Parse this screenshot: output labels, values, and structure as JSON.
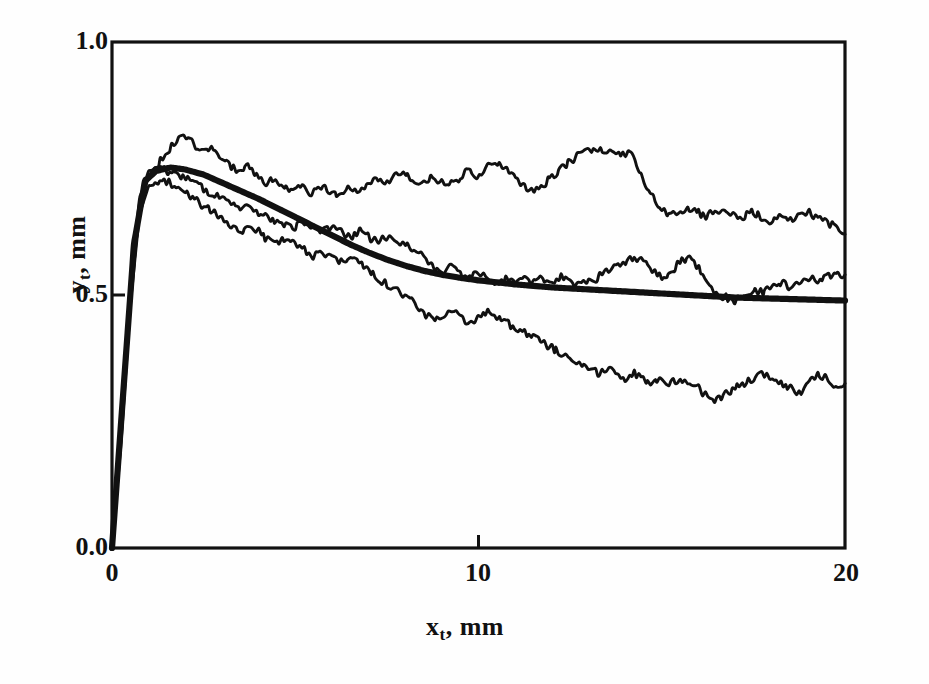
{
  "figure": {
    "background": "#fefefe",
    "ink_color": "#111111"
  },
  "axes": {
    "y_label_main": "y",
    "y_label_sub": "t",
    "y_label_tail": ", mm",
    "x_label_main": "x",
    "x_label_sub": "t",
    "x_label_tail": ", mm",
    "y_ticks": [
      "1.0",
      "0.5",
      "0.0"
    ],
    "x_ticks": [
      "0",
      "10",
      "20"
    ]
  },
  "chart_data": {
    "type": "line",
    "title": "",
    "xlabel": "x_t , mm",
    "ylabel": "y_t , mm",
    "xlim": [
      0,
      20
    ],
    "ylim": [
      0.0,
      1.0
    ],
    "xticks": [
      0,
      10,
      20
    ],
    "yticks": [
      0.0,
      0.5,
      1.0
    ],
    "grid": false,
    "legend": "none",
    "frame": "box",
    "series": [
      {
        "name": "upper-noisy-trace",
        "style": "thin-noisy",
        "x": [
          0,
          0.25,
          0.5,
          0.75,
          1.0,
          1.2,
          1.45,
          1.7,
          1.95,
          2.2,
          2.45,
          2.7,
          2.95,
          3.2,
          3.45,
          3.7,
          3.95,
          4.2,
          4.45,
          4.7,
          4.95,
          5.2,
          5.45,
          5.7,
          5.95,
          6.2,
          6.45,
          6.7,
          6.95,
          7.2,
          7.45,
          7.7,
          7.95,
          8.2,
          8.45,
          8.7,
          8.95,
          9.2,
          9.45,
          9.7,
          9.95,
          10.2,
          10.45,
          10.7,
          10.95,
          11.2,
          11.45,
          11.7,
          11.95,
          12.2,
          12.45,
          12.7,
          12.95,
          13.2,
          13.45,
          13.7,
          13.95,
          14.2,
          14.45,
          14.7,
          14.95,
          15.2,
          15.45,
          15.7,
          15.95,
          16.2,
          16.45,
          16.7,
          16.95,
          17.2,
          17.45,
          17.7,
          17.95,
          18.2,
          18.45,
          18.7,
          18.95,
          19.2,
          19.45,
          19.7,
          20
        ],
        "y": [
          0.0,
          0.22,
          0.49,
          0.67,
          0.735,
          0.755,
          0.775,
          0.8,
          0.812,
          0.8,
          0.785,
          0.79,
          0.775,
          0.755,
          0.745,
          0.755,
          0.735,
          0.72,
          0.73,
          0.715,
          0.705,
          0.715,
          0.7,
          0.715,
          0.705,
          0.695,
          0.71,
          0.7,
          0.715,
          0.73,
          0.72,
          0.735,
          0.745,
          0.73,
          0.72,
          0.735,
          0.725,
          0.715,
          0.73,
          0.745,
          0.735,
          0.75,
          0.765,
          0.75,
          0.735,
          0.72,
          0.705,
          0.715,
          0.73,
          0.745,
          0.76,
          0.775,
          0.785,
          0.79,
          0.785,
          0.775,
          0.78,
          0.775,
          0.735,
          0.7,
          0.675,
          0.655,
          0.665,
          0.67,
          0.665,
          0.655,
          0.665,
          0.67,
          0.66,
          0.655,
          0.665,
          0.655,
          0.645,
          0.655,
          0.645,
          0.655,
          0.665,
          0.655,
          0.645,
          0.635,
          0.62
        ]
      },
      {
        "name": "middle-noisy-trace",
        "style": "thin-noisy",
        "x": [
          0,
          0.25,
          0.5,
          0.75,
          1.0,
          1.25,
          1.5,
          1.75,
          2.0,
          2.25,
          2.5,
          2.75,
          3.0,
          3.25,
          3.5,
          3.75,
          4.0,
          4.25,
          4.5,
          4.75,
          5.0,
          5.25,
          5.5,
          5.75,
          6.0,
          6.25,
          6.5,
          6.75,
          7.0,
          7.25,
          7.5,
          7.75,
          8.0,
          8.25,
          8.5,
          8.75,
          9.0,
          9.25,
          9.5,
          9.75,
          10.0,
          10.25,
          10.5,
          10.75,
          11.0,
          11.25,
          11.5,
          11.75,
          12.0,
          12.25,
          12.5,
          12.75,
          13.0,
          13.25,
          13.5,
          13.75,
          14.0,
          14.25,
          14.5,
          14.75,
          15.0,
          15.25,
          15.5,
          15.75,
          16.0,
          16.25,
          16.5,
          16.75,
          17.0,
          17.25,
          17.5,
          17.75,
          18.0,
          18.25,
          18.5,
          18.75,
          19.0,
          19.25,
          19.5,
          19.75,
          20
        ],
        "y": [
          0.0,
          0.24,
          0.52,
          0.69,
          0.745,
          0.75,
          0.745,
          0.735,
          0.73,
          0.72,
          0.71,
          0.7,
          0.695,
          0.685,
          0.675,
          0.67,
          0.66,
          0.655,
          0.645,
          0.64,
          0.635,
          0.645,
          0.635,
          0.625,
          0.635,
          0.625,
          0.615,
          0.625,
          0.615,
          0.605,
          0.615,
          0.605,
          0.6,
          0.59,
          0.575,
          0.555,
          0.545,
          0.555,
          0.545,
          0.535,
          0.545,
          0.535,
          0.525,
          0.535,
          0.525,
          0.535,
          0.525,
          0.535,
          0.525,
          0.535,
          0.525,
          0.52,
          0.525,
          0.535,
          0.545,
          0.555,
          0.565,
          0.575,
          0.565,
          0.545,
          0.535,
          0.545,
          0.565,
          0.57,
          0.555,
          0.525,
          0.505,
          0.495,
          0.49,
          0.5,
          0.51,
          0.505,
          0.515,
          0.525,
          0.515,
          0.525,
          0.535,
          0.525,
          0.535,
          0.545,
          0.54
        ]
      },
      {
        "name": "lower-noisy-trace",
        "style": "thin-noisy",
        "x": [
          0,
          0.25,
          0.5,
          0.75,
          1.0,
          1.25,
          1.5,
          1.75,
          2.0,
          2.25,
          2.5,
          2.75,
          3.0,
          3.25,
          3.5,
          3.75,
          4.0,
          4.25,
          4.5,
          4.75,
          5.0,
          5.25,
          5.5,
          5.75,
          6.0,
          6.25,
          6.5,
          6.75,
          7.0,
          7.25,
          7.5,
          7.75,
          8.0,
          8.25,
          8.5,
          8.75,
          9.0,
          9.25,
          9.5,
          9.75,
          10.0,
          10.25,
          10.5,
          10.75,
          11.0,
          11.25,
          11.5,
          11.75,
          12.0,
          12.25,
          12.5,
          12.75,
          13.0,
          13.25,
          13.5,
          13.75,
          14.0,
          14.25,
          14.5,
          14.75,
          15.0,
          15.25,
          15.5,
          15.75,
          16.0,
          16.25,
          16.5,
          16.75,
          17.0,
          17.25,
          17.5,
          17.75,
          18.0,
          18.25,
          18.5,
          18.75,
          19.0,
          19.25,
          19.5,
          19.75,
          20
        ],
        "y": [
          0.0,
          0.21,
          0.48,
          0.66,
          0.715,
          0.72,
          0.725,
          0.715,
          0.705,
          0.69,
          0.675,
          0.665,
          0.65,
          0.635,
          0.625,
          0.635,
          0.625,
          0.61,
          0.6,
          0.615,
          0.605,
          0.59,
          0.575,
          0.585,
          0.575,
          0.565,
          0.575,
          0.565,
          0.55,
          0.535,
          0.52,
          0.51,
          0.5,
          0.485,
          0.465,
          0.45,
          0.46,
          0.47,
          0.455,
          0.445,
          0.455,
          0.465,
          0.455,
          0.445,
          0.435,
          0.425,
          0.415,
          0.405,
          0.395,
          0.385,
          0.375,
          0.365,
          0.355,
          0.345,
          0.355,
          0.345,
          0.335,
          0.345,
          0.335,
          0.325,
          0.335,
          0.325,
          0.335,
          0.325,
          0.315,
          0.3,
          0.29,
          0.305,
          0.315,
          0.325,
          0.335,
          0.345,
          0.335,
          0.325,
          0.315,
          0.305,
          0.325,
          0.345,
          0.335,
          0.32,
          0.325
        ]
      },
      {
        "name": "smooth-fitted-curve",
        "style": "thick-smooth",
        "x": [
          0,
          0.3,
          0.6,
          0.9,
          1.2,
          1.6,
          2.0,
          2.5,
          3.0,
          3.5,
          4.0,
          4.5,
          5.0,
          5.5,
          6.0,
          6.5,
          7.0,
          7.5,
          8.0,
          8.5,
          9.0,
          9.5,
          10.0,
          10.5,
          11.0,
          11.5,
          12.0,
          12.5,
          13.0,
          13.5,
          14.0,
          14.5,
          15.0,
          15.5,
          16.0,
          16.5,
          17.0,
          17.5,
          18.0,
          18.5,
          19.0,
          19.5,
          20
        ],
        "y": [
          0.0,
          0.3,
          0.6,
          0.725,
          0.745,
          0.752,
          0.748,
          0.738,
          0.722,
          0.706,
          0.69,
          0.672,
          0.654,
          0.636,
          0.618,
          0.6,
          0.584,
          0.57,
          0.558,
          0.548,
          0.54,
          0.534,
          0.529,
          0.525,
          0.521,
          0.518,
          0.515,
          0.513,
          0.511,
          0.509,
          0.507,
          0.505,
          0.503,
          0.501,
          0.499,
          0.497,
          0.495,
          0.494,
          0.493,
          0.492,
          0.491,
          0.49,
          0.489
        ]
      }
    ]
  }
}
